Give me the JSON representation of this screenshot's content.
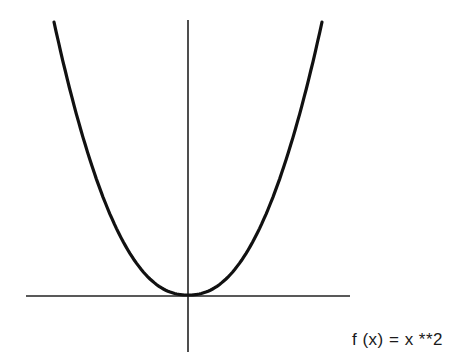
{
  "figure": {
    "caption": "f (x) = x **2",
    "function": "x**2"
  },
  "chart_data": {
    "type": "line",
    "title": "",
    "caption": "f (x) = x **2",
    "xlabel": "",
    "ylabel": "",
    "grid": false,
    "ticks": false,
    "series": [
      {
        "name": "f(x) = x**2",
        "expression": "x**2",
        "x_range": [
          -1,
          1
        ]
      }
    ],
    "axes": {
      "x_axis_px": [
        26,
        350,
        296
      ],
      "y_axis_px": [
        188,
        20,
        352
      ]
    },
    "colors": {
      "curve": "#111111",
      "axes": "#222222"
    }
  }
}
